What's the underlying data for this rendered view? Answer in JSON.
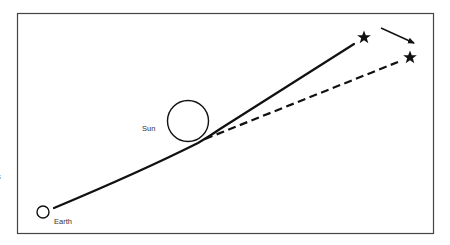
{
  "diagram": {
    "labels": {
      "sun": "Sun",
      "earth": "Earth",
      "cut_off_left": "s"
    },
    "elements": {
      "frame": {
        "x": 17,
        "y": 13,
        "width": 417,
        "height": 221
      },
      "earth": {
        "cx": 43,
        "cy": 212,
        "r": 6
      },
      "sun": {
        "cx": 188,
        "cy": 121,
        "r": 20
      },
      "actual_light_path": {
        "style": "solid",
        "from": [
          54,
          208
        ],
        "bend": [
          205,
          139
        ],
        "to": [
          354,
          44
        ]
      },
      "apparent_light_path": {
        "style": "dashed",
        "from": [
          205,
          139
        ],
        "to": [
          398,
          62
        ]
      },
      "actual_star": {
        "x": 364,
        "y": 37
      },
      "apparent_star": {
        "x": 410,
        "y": 57
      },
      "shift_arrow": {
        "from": [
          381,
          28
        ],
        "to": [
          416,
          44
        ]
      }
    },
    "colors": {
      "ink": "#111111",
      "frame": "#444444",
      "background": "#ffffff"
    }
  }
}
